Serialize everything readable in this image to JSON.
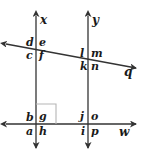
{
  "diagram": {
    "kind": "geometry-transversal-figure",
    "stroke_color": "#333333",
    "label_color": "#1a1a1a",
    "background_color": "#ffffff",
    "lines": [
      {
        "name": "x",
        "label": "x",
        "orientation": "vertical",
        "x": 36,
        "y1": 14,
        "y2": 150,
        "arrow_start": true,
        "arrow_end": true
      },
      {
        "name": "y",
        "label": "y",
        "orientation": "vertical",
        "x": 88,
        "y1": 14,
        "y2": 150,
        "arrow_start": true,
        "arrow_end": true
      },
      {
        "name": "w",
        "label": "w",
        "orientation": "horizontal",
        "y": 124,
        "x1": 4,
        "x2": 138,
        "arrow_start": true,
        "arrow_end": true
      },
      {
        "name": "q",
        "label": "q",
        "orientation": "oblique",
        "x1": 4,
        "y1": 44,
        "x2": 138,
        "y2": 69,
        "arrow_start": true,
        "arrow_end": true
      }
    ],
    "line_labels": [
      {
        "id": "label-x",
        "text": "x",
        "left": 40,
        "top": 14
      },
      {
        "id": "label-y",
        "text": "y",
        "left": 92,
        "top": 14
      },
      {
        "id": "label-q",
        "text": "q",
        "left": 124,
        "top": 66
      },
      {
        "id": "label-w",
        "text": "w",
        "left": 120,
        "top": 127
      }
    ],
    "intersections": [
      {
        "id": "upper-left",
        "lines": [
          "x",
          "q"
        ],
        "point": {
          "x": 36,
          "y": 49
        },
        "angles": [
          {
            "letter": "d",
            "position": "upper-left",
            "left": 25,
            "top": 37
          },
          {
            "letter": "e",
            "position": "upper-right",
            "left": 39,
            "top": 37
          },
          {
            "letter": "c",
            "position": "lower-left",
            "left": 25,
            "top": 50
          },
          {
            "letter": "f",
            "position": "lower-right",
            "left": 39,
            "top": 50
          }
        ]
      },
      {
        "id": "upper-right",
        "lines": [
          "y",
          "q"
        ],
        "point": {
          "x": 88,
          "y": 59
        },
        "angles": [
          {
            "letter": "l",
            "position": "upper-left",
            "left": 79,
            "top": 48
          },
          {
            "letter": "m",
            "position": "upper-right",
            "left": 91,
            "top": 48
          },
          {
            "letter": "k",
            "position": "lower-left",
            "left": 79,
            "top": 61
          },
          {
            "letter": "n",
            "position": "lower-right",
            "left": 91,
            "top": 61
          }
        ]
      },
      {
        "id": "lower-left",
        "lines": [
          "x",
          "w"
        ],
        "point": {
          "x": 36,
          "y": 124
        },
        "right_angle_marker": {
          "left": 36,
          "top": 104,
          "size": 20
        },
        "angles": [
          {
            "letter": "b",
            "position": "upper-left",
            "left": 25,
            "top": 112
          },
          {
            "letter": "g",
            "position": "upper-right",
            "left": 39,
            "top": 112
          },
          {
            "letter": "a",
            "position": "lower-left",
            "left": 25,
            "top": 126
          },
          {
            "letter": "h",
            "position": "lower-right",
            "left": 39,
            "top": 126
          }
        ]
      },
      {
        "id": "lower-right",
        "lines": [
          "y",
          "w"
        ],
        "point": {
          "x": 88,
          "y": 124
        },
        "angles": [
          {
            "letter": "j",
            "position": "upper-left",
            "left": 79,
            "top": 112
          },
          {
            "letter": "o",
            "position": "upper-right",
            "left": 91,
            "top": 112
          },
          {
            "letter": "i",
            "position": "lower-left",
            "left": 79,
            "top": 126
          },
          {
            "letter": "p",
            "position": "lower-right",
            "left": 91,
            "top": 126
          }
        ]
      }
    ]
  }
}
